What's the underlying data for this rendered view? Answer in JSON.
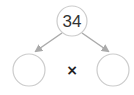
{
  "diagram": {
    "type": "factor-tree",
    "root": {
      "value": "34"
    },
    "children": [
      {
        "value": ""
      },
      {
        "value": ""
      }
    ],
    "operator": "×",
    "colors": {
      "circle_stroke": "#cccccc",
      "arrow": "#aaaaaa",
      "text": "#333333"
    }
  }
}
